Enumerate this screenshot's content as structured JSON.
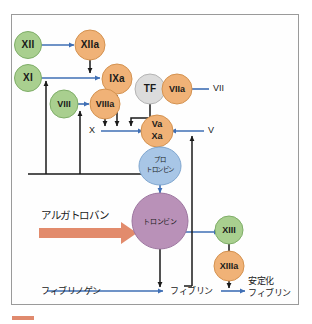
{
  "diagram": {
    "frame": {
      "border_color": "#9a9a9a",
      "background": "#fefefe"
    },
    "colors": {
      "green_factor": "#a9cf8f",
      "green_factor_stroke": "#7fae68",
      "orange_factor": "#f0b277",
      "orange_factor_stroke": "#d49250",
      "gray_factor": "#dcdcdc",
      "gray_factor_stroke": "#b4b4b4",
      "blue_node": "#a8c6e6",
      "blue_node_stroke": "#7fa6cf",
      "purple_node": "#b991b8",
      "purple_node_stroke": "#9d76a0",
      "blue_arrow": "#3f6fb5",
      "black_arrow": "#1a1a1a",
      "drug_arrow": "#e28b6c",
      "corner_mark": "#e08a6e"
    },
    "nodes": [
      {
        "id": "f12",
        "label": "XII",
        "type": "green",
        "shape": "circle"
      },
      {
        "id": "f12a",
        "label": "XIIa",
        "type": "orange",
        "shape": "circle"
      },
      {
        "id": "f11",
        "label": "XI",
        "type": "green",
        "shape": "circle"
      },
      {
        "id": "f9a",
        "label": "IXa",
        "type": "orange",
        "shape": "circle"
      },
      {
        "id": "f8",
        "label": "VIII",
        "type": "green",
        "shape": "circle"
      },
      {
        "id": "f8a",
        "label": "VIIIa",
        "type": "orange",
        "shape": "circle"
      },
      {
        "id": "tf",
        "label": "TF",
        "type": "gray",
        "shape": "circle"
      },
      {
        "id": "f7a",
        "label": "VIIa",
        "type": "orange",
        "shape": "circle"
      },
      {
        "id": "vaxa_a",
        "label": "Va",
        "type": "orange",
        "shape": "circle"
      },
      {
        "id": "vaxa_b",
        "label": "Xa",
        "type": "orange",
        "shape": "circle"
      },
      {
        "id": "f13",
        "label": "XIII",
        "type": "green",
        "shape": "circle"
      },
      {
        "id": "f13a",
        "label": "XIIIa",
        "type": "orange",
        "shape": "circle"
      },
      {
        "id": "prothrombin",
        "label_line1": "プロ",
        "label_line2": "トロンビン",
        "type": "blue",
        "shape": "ellipse"
      },
      {
        "id": "thrombin",
        "label": "トロンビン",
        "type": "purple",
        "shape": "circle"
      }
    ],
    "plain_labels": [
      {
        "id": "f7",
        "label": "VII"
      },
      {
        "id": "f10",
        "label": "X"
      },
      {
        "id": "f5",
        "label": "V"
      }
    ],
    "japanese_labels": [
      {
        "id": "argatroban",
        "label": "アルガトロバン"
      },
      {
        "id": "fibrinogen",
        "label": "フィブリノゲン"
      },
      {
        "id": "fibrin",
        "label": "フィブリン"
      },
      {
        "id": "stabilized_fibrin_1",
        "label": "安定化"
      },
      {
        "id": "stabilized_fibrin_2",
        "label": "フィブリン"
      }
    ],
    "arrows": [
      {
        "from": "XII",
        "to": "XIIa",
        "color": "blue"
      },
      {
        "from": "XIIa",
        "to": "IXa",
        "color": "black"
      },
      {
        "from": "XI",
        "to": "IXa",
        "color": "blue"
      },
      {
        "from": "VIII",
        "to": "VIIIa",
        "color": "blue"
      },
      {
        "from": "IXa",
        "to": "Va/Xa",
        "color": "black"
      },
      {
        "from": "VIIIa",
        "to": "Va/Xa",
        "color": "black"
      },
      {
        "from": "TF",
        "to": "Va/Xa",
        "color": "black"
      },
      {
        "from": "VII",
        "to": "VIIa",
        "color": "blue"
      },
      {
        "from": "X",
        "to": "Va/Xa",
        "color": "blue"
      },
      {
        "from": "V",
        "to": "Va/Xa",
        "color": "blue"
      },
      {
        "from": "Va/Xa",
        "to": "prothrombin",
        "color": "black"
      },
      {
        "from": "prothrombin",
        "to": "thrombin",
        "color": "blue"
      },
      {
        "from": "thrombin",
        "to": "XIII -> XIIIa",
        "color": "blue"
      },
      {
        "from": "XIII",
        "to": "XIIIa",
        "color": "black"
      },
      {
        "from": "XIIIa",
        "to": "fibrin bond",
        "color": "black"
      },
      {
        "from": "thrombin",
        "to": "fibrinogen->fibrin",
        "color": "black"
      },
      {
        "from": "fibrinogen",
        "to": "fibrin",
        "color": "blue"
      },
      {
        "from": "fibrin",
        "to": "安定化フィブリン",
        "color": "blue"
      },
      {
        "from": "thrombin feedback",
        "to": "XI and VIII",
        "color": "black"
      },
      {
        "from": "thrombin feedback",
        "to": "V",
        "color": "black"
      },
      {
        "from": "argatroban",
        "to": "thrombin (inhibition)",
        "color": "salmon"
      }
    ]
  }
}
